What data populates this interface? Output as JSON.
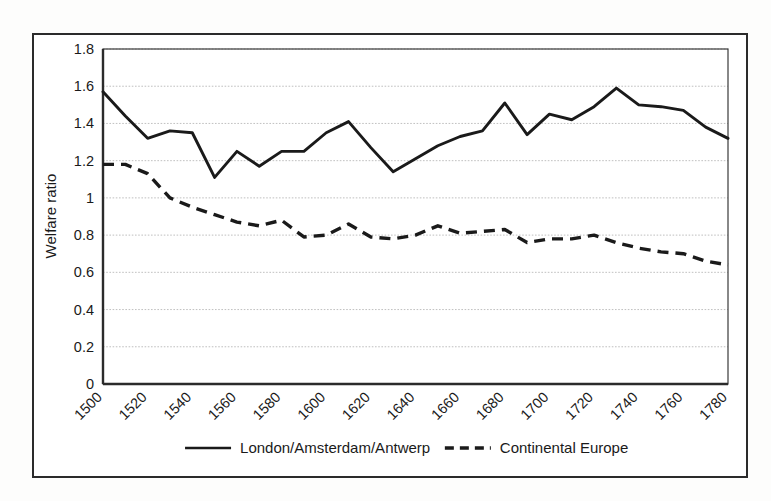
{
  "chart_data": {
    "type": "line",
    "title": "",
    "subtitle": "",
    "xlabel": "",
    "ylabel": "Welfare ratio",
    "xlim": [
      1500,
      1780
    ],
    "ylim": [
      0,
      1.8
    ],
    "grid": true,
    "legend_position": "bottom",
    "x_tick_labels": [
      "1500",
      "1520",
      "1540",
      "1560",
      "1580",
      "1600",
      "1620",
      "1640",
      "1660",
      "1680",
      "1700",
      "1720",
      "1740",
      "1760",
      "1780"
    ],
    "y_tick_labels": [
      "0",
      "0.2",
      "0.4",
      "0.6",
      "0.8",
      "1",
      "1.2",
      "1.4",
      "1.6",
      "1.8"
    ],
    "y_tick_values": [
      0,
      0.2,
      0.4,
      0.6,
      0.8,
      1.0,
      1.2,
      1.4,
      1.6,
      1.8
    ],
    "x": [
      1500,
      1510,
      1520,
      1530,
      1540,
      1550,
      1560,
      1570,
      1580,
      1590,
      1600,
      1610,
      1620,
      1630,
      1640,
      1650,
      1660,
      1670,
      1680,
      1690,
      1700,
      1710,
      1720,
      1730,
      1740,
      1750,
      1760,
      1770,
      1780
    ],
    "series": [
      {
        "name": "London/Amsterdam/Antwerp",
        "style": "solid",
        "color": "#1a1a1a",
        "values": [
          1.57,
          1.44,
          1.32,
          1.36,
          1.35,
          1.11,
          1.25,
          1.17,
          1.25,
          1.25,
          1.35,
          1.41,
          1.27,
          1.14,
          1.21,
          1.28,
          1.33,
          1.36,
          1.51,
          1.34,
          1.45,
          1.42,
          1.49,
          1.59,
          1.5,
          1.49,
          1.47,
          1.38,
          1.32
        ]
      },
      {
        "name": "Continental Europe",
        "style": "dashed",
        "color": "#1a1a1a",
        "values": [
          1.18,
          1.18,
          1.13,
          1.0,
          0.95,
          0.91,
          0.87,
          0.85,
          0.88,
          0.79,
          0.8,
          0.86,
          0.79,
          0.78,
          0.8,
          0.85,
          0.81,
          0.82,
          0.83,
          0.76,
          0.78,
          0.78,
          0.8,
          0.76,
          0.73,
          0.71,
          0.7,
          0.66,
          0.64
        ]
      }
    ],
    "legend": [
      {
        "label": "London/Amsterdam/Antwerp",
        "style": "solid"
      },
      {
        "label": "Continental Europe",
        "style": "dashed"
      }
    ]
  }
}
